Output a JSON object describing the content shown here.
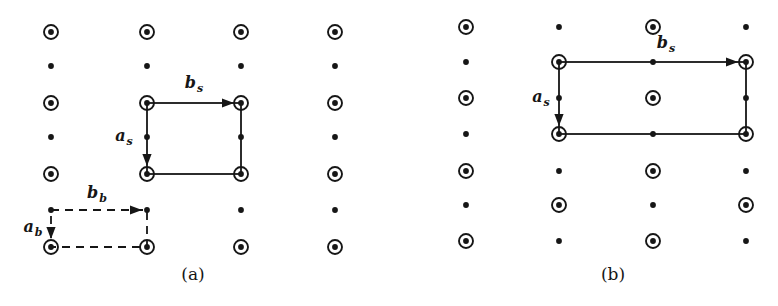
{
  "colors": {
    "background": "#ffffff",
    "ink": "#161616"
  },
  "legend": {
    "O": "circled-dot",
    "o": "dot"
  },
  "figures": [
    {
      "id": "a",
      "caption": "(a)",
      "caption_pos": {
        "x": 193,
        "y": 274
      },
      "lattice": {
        "columns_x": [
          51,
          147,
          241,
          335
        ],
        "rows_y": [
          32,
          66,
          103,
          137,
          174,
          210,
          247
        ],
        "grid": [
          "OOOO",
          "oooo",
          "OOOO",
          "oooo",
          "OOOO",
          "oooo",
          "OOOO"
        ]
      },
      "meshes": [
        {
          "name": "surface-mesh",
          "line_style": "solid",
          "rect": {
            "x1": 147,
            "y1": 103,
            "x2": 241,
            "y2": 174
          },
          "vectors": [
            {
              "base": "b",
              "sub": "s",
              "label_pos": {
                "x": 194,
                "y": 84
              },
              "arrow": {
                "tip": {
                  "x": 234,
                  "y": 103
                },
                "dir": "right"
              }
            },
            {
              "base": "a",
              "sub": "s",
              "label_pos": {
                "x": 124,
                "y": 137
              },
              "arrow": {
                "tip": {
                  "x": 147,
                  "y": 166
                },
                "dir": "down"
              }
            }
          ]
        },
        {
          "name": "bulk-mesh",
          "line_style": "dashed",
          "rect": {
            "x1": 51,
            "y1": 210,
            "x2": 147,
            "y2": 247
          },
          "vectors": [
            {
              "base": "b",
              "sub": "b",
              "label_pos": {
                "x": 97,
                "y": 194
              },
              "arrow": {
                "tip": {
                  "x": 142,
                  "y": 210
                },
                "dir": "right"
              }
            },
            {
              "base": "a",
              "sub": "b",
              "label_pos": {
                "x": 33,
                "y": 228
              },
              "arrow": {
                "tip": {
                  "x": 51,
                  "y": 239
                },
                "dir": "down"
              }
            }
          ]
        }
      ]
    },
    {
      "id": "b",
      "caption": "(b)",
      "caption_pos": {
        "x": 613,
        "y": 274
      },
      "lattice": {
        "columns_x": [
          466,
          559,
          653,
          746
        ],
        "rows_y": [
          27,
          62,
          98,
          134,
          171,
          205,
          241
        ],
        "grid": [
          "OoOo",
          "oOoO",
          "OoOo",
          "oOoO",
          "OoOo",
          "oOoO",
          "OoOo"
        ]
      },
      "meshes": [
        {
          "name": "surface-mesh",
          "line_style": "solid",
          "rect": {
            "x1": 559,
            "y1": 62,
            "x2": 746,
            "y2": 134
          },
          "vectors": [
            {
              "base": "b",
              "sub": "s",
              "label_pos": {
                "x": 666,
                "y": 44
              },
              "arrow": {
                "tip": {
                  "x": 738,
                  "y": 62
                },
                "dir": "right"
              }
            },
            {
              "base": "a",
              "sub": "s",
              "label_pos": {
                "x": 541,
                "y": 98
              },
              "arrow": {
                "tip": {
                  "x": 559,
                  "y": 126
                },
                "dir": "down"
              }
            }
          ]
        }
      ]
    }
  ]
}
